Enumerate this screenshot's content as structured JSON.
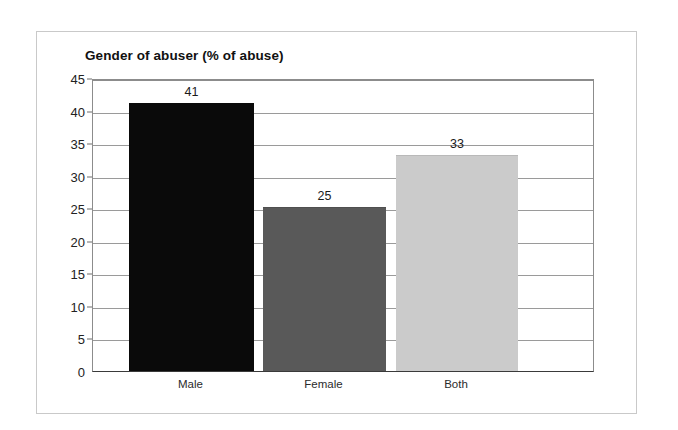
{
  "chart_data": {
    "type": "bar",
    "title": "Gender of abuser (% of abuse)",
    "xlabel": "",
    "ylabel": "",
    "categories": [
      "Male",
      "Female",
      "Both"
    ],
    "values": [
      41,
      25,
      33
    ],
    "value_labels": [
      "41",
      "25",
      "33"
    ],
    "ylim": [
      0,
      45
    ],
    "ytick_step": 5,
    "ytick_labels": [
      "0",
      "5",
      "10",
      "15",
      "20",
      "25",
      "30",
      "35",
      "40",
      "45"
    ],
    "grid": "horizontal",
    "legend": "none",
    "bar_colors": [
      "#0a0a0a",
      "#595959",
      "#cbcbcb"
    ],
    "bar_border_colors": [
      "#0a0a0a",
      "#4f4f4f",
      "#b9b9b9"
    ]
  },
  "frame": {
    "background_color": "#ffffff",
    "border_color": "#c9c9c9"
  },
  "axis": {
    "line_color": "#3a3a3a",
    "grid_color": "#9a9a9a"
  }
}
